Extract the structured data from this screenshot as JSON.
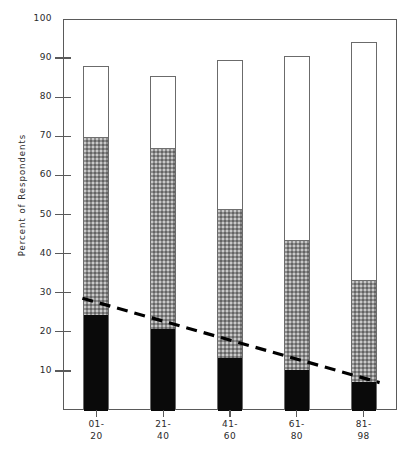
{
  "chart_data": {
    "type": "bar",
    "subtype": "stacked-bar-with-trendline",
    "title": "",
    "xlabel": "",
    "ylabel": "Percent of Respondents",
    "ylim": [
      0,
      100
    ],
    "yticks": [
      10,
      20,
      30,
      40,
      50,
      60,
      70,
      80,
      90,
      100
    ],
    "ytick_labels": [
      "10",
      "20",
      "30",
      "40",
      "50",
      "60",
      "70",
      "80",
      "90",
      "100"
    ],
    "grid": false,
    "legend": "none",
    "categories": [
      "01-20",
      "21-40",
      "41-60",
      "61-80",
      "81-98"
    ],
    "category_lines": [
      {
        "l1": "01-",
        "l2": "20"
      },
      {
        "l1": "21-",
        "l2": "40"
      },
      {
        "l1": "41-",
        "l2": "60"
      },
      {
        "l1": "61-",
        "l2": "80"
      },
      {
        "l1": "81-",
        "l2": "98"
      }
    ],
    "series": [
      {
        "name": "black-segment",
        "color": "#0a0a0a",
        "values": [
          24.5,
          21.0,
          13.5,
          10.5,
          7.5
        ]
      },
      {
        "name": "gray-segment",
        "color": "#8d8d8d",
        "values": [
          45.5,
          46.3,
          38.2,
          33.2,
          26.0
        ]
      },
      {
        "name": "white-segment",
        "color": "#ffffff",
        "values": [
          18.0,
          18.2,
          37.8,
          46.8,
          60.5
        ]
      }
    ],
    "cumulative_tops": {
      "black": [
        24.5,
        21.0,
        13.5,
        10.5,
        7.5
      ],
      "gray": [
        70.0,
        67.3,
        51.7,
        43.7,
        33.5
      ],
      "white": [
        88.0,
        85.5,
        89.5,
        90.5,
        94.0
      ]
    },
    "bar_totals": [
      88.0,
      85.5,
      89.5,
      90.5,
      94.0
    ],
    "trendline": {
      "style": "dashed",
      "color": "#000000",
      "x_start_category": "01-20",
      "x_end_category": "81-98",
      "y_start": 28.6,
      "y_end": 7.0
    }
  },
  "axis": {
    "y_title": "Percent of Respondents"
  }
}
